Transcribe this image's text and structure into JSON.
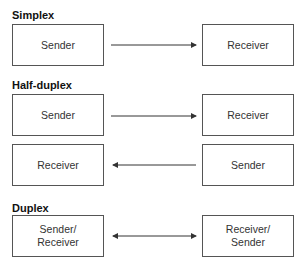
{
  "sections": [
    {
      "title": "Simplex",
      "rows": [
        {
          "left": "Sender",
          "right": "Receiver",
          "direction": "right"
        }
      ]
    },
    {
      "title": "Half-duplex",
      "rows": [
        {
          "left": "Sender",
          "right": "Receiver",
          "direction": "right"
        },
        {
          "left": "Receiver",
          "right": "Sender",
          "direction": "left"
        }
      ]
    },
    {
      "title": "Duplex",
      "rows": [
        {
          "left": "Sender/\nReceiver",
          "right": "Receiver/\nSender",
          "direction": "both"
        }
      ]
    }
  ],
  "colors": {
    "line": "#333333",
    "border": "#555555",
    "text": "#333333"
  }
}
